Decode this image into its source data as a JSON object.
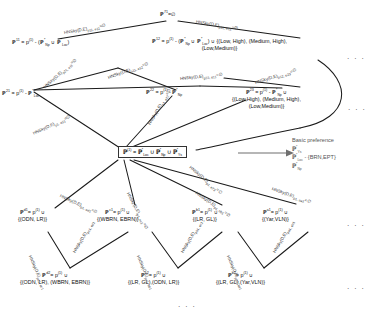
{
  "diagram": {
    "edge_label_base": "HNSky(D,E)",
    "ellipsis": "· · ·",
    "root": {
      "id": "root-box",
      "text": "ℙ⁽¹⁾ = ℙ*Loc ∪ ℙ*Np ∪ ℙ*Ys",
      "html": "<b>ℙ</b><sup>(1)</sup> = <b>ℙ</b><sup>*</sup><sub>Loc</sub> ∪ <b>ℙ</b><sup>*</sup><sub>Np</sub> ∪ <b>ℙ</b><sup>*</sup><sub>Ys</sub>"
    },
    "basic_preference": {
      "heading": "Basic preference",
      "items": [
        "ℙ*Ys",
        "ℙ*Loc - {BRN,EPT}",
        "ℙ*Np"
      ],
      "items_html": [
        "<b>ℙ</b><sup>*</sup><sub>Ys</sub>",
        "<b>ℙ</b><sup>*</sup><sub>Loc</sub> - {BRN,EPT}",
        "<b>ℙ</b><sup>*</sup><sub>Np</sub>"
      ]
    },
    "nodes": [
      {
        "id": "n-p71",
        "label": "ℙ⁷¹ = ∅",
        "html": "<b>ℙ</b><sup>71</sup>=∅",
        "x": 166,
        "y": 13
      },
      {
        "id": "n-p11",
        "label": "ℙ11 = p(1) - (ℙ*Np ∪ ℙ*Loc)",
        "html": "<b>ℙ</b><sup>11</sup> = p<sup>(1)</sup> - (<b>ℙ</b><sup>*</sup><sub>Np</sub> ∪ <b>ℙ</b><sup>*</sup><sub>Loc</sub>)",
        "x": 25,
        "y": 41
      },
      {
        "id": "n-p12",
        "label": "ℙ12 = p(1) - (ℙ*Np ∪ ℙ*Loc) ∪ {(Low, High), (Medium, High), (Low,Medium)}",
        "html": "<b>ℙ</b><sup>12</sup> = p<sup>(1)</sup> - (<b>ℙ</b><sup>*</sup><sub>Np</sub> ∪ <b>ℙ</b><sup>*</sup><sub>Loc</sub>) ∪ {(Low, High), (Medium, High),<br>(Low,Medium)}",
        "x": 157,
        "y": 40
      },
      {
        "id": "n-p21",
        "label": "ℙ21 = p(1) - ℙ*Loc",
        "html": "<b>ℙ</b><sup>21</sup> = p<sup>(1)</sup> - <b>ℙ</b><sup>*</sup><sub>Loc</sub>",
        "x": 8,
        "y": 92
      },
      {
        "id": "n-p22",
        "label": "ℙ22 = p(1) - ℙ*Np",
        "html": "<b>ℙ</b><sup>22</sup> = p<sup>(1)</sup> - <b>ℙ</b><sup>*</sup><sub>Np</sub>",
        "x": 155,
        "y": 91
      },
      {
        "id": "n-p23",
        "label": "ℙ23 = p(1) - ℙ*Np ∪ {(Low,High), (Medium, High), (Low,Medium)}",
        "html": "<b>ℙ</b><sup>23</sup> = p<sup>(1)</sup> - <b>ℙ</b><sup>*</sup><sub>Np</sub> ∪<br>{(Low,High), (Medium, High),<br>(Low,Medium)}",
        "x": 249,
        "y": 91
      },
      {
        "id": "n-pd1",
        "label": "ℙd1 = p(1) ∪ {(ODN, LR)}",
        "html": "<b>ℙ</b><sup>d1</sup>= p<sup>(1)</sup> ∪<br>{(ODN, LR)}",
        "x": 27,
        "y": 211
      },
      {
        "id": "n-pc1",
        "label": "ℙc1 = p(1) ∪ {(WBRN, EBRN)}",
        "html": "<b>ℙ</b><sup>c1</sup>= p<sup>(1)</sup> ∪<br>{(WBRN, EBRN)}",
        "x": 113,
        "y": 211
      },
      {
        "id": "n-pb1",
        "label": "ℙb1 = p(1) ∪ {(LR, GL)}",
        "html": "<b>ℙ</b><sup>b1</sup>= p<sup>(1)</sup> ∪<br>{(LR, GL)}",
        "x": 204,
        "y": 211
      },
      {
        "id": "n-pa1",
        "label": "ℙa1 = p(1) ∪ {(Yar,VLN)}",
        "html": "<b>ℙ</b><sup>a1</sup>= p<sup>(1)</sup> ∪<br>{(Yar,VLN)}",
        "x": 275,
        "y": 211
      },
      {
        "id": "n-pd2",
        "label": "ℙd2 = p(1) ∪ {(ODN, LR), (WBRN, EBRN)}",
        "html": "<b>ℙ</b><sup>d2</sup>= p<sup>(1)</sup> ∪<br>{(ODN, LR), (WBRN, EBRN)}",
        "x": 33,
        "y": 274
      },
      {
        "id": "n-pc2",
        "label": "ℙc2 = p(1) ∪ {(LR, GL),(ODN, LR)}",
        "html": "<b>ℙ</b><sup>c2</sup>= p<sup>(1)</sup> ∪<br>{(LR, GL),(ODN, LR)}",
        "x": 141,
        "y": 274
      },
      {
        "id": "n-pb2",
        "label": "ℙb2 = p(1) ∪ {(LR, GL),(Yar,VLN)}",
        "html": "<b>ℙ</b><sup>b2</sup>= p<sup>(1)</sup> ∪<br>{(LR, GL),(Yar,VLN)}",
        "x": 232,
        "y": 274
      }
    ],
    "edge_labels": [
      {
        "id": "el-1",
        "html": "HNSky(D,E)<sub>p11, e11</sub>=∅",
        "x": 64,
        "y": 30,
        "rot": -10
      },
      {
        "id": "el-2",
        "html": "HNSky(D,E)<sub>p11, e12</sub>=∅",
        "x": 196,
        "y": 19,
        "rot": 9
      },
      {
        "id": "el-3",
        "html": "HNSky(D,E)<sub>p21, e11</sub>=∅",
        "x": 44,
        "y": 85,
        "rot": -42
      },
      {
        "id": "el-4",
        "html": "HNSky(D,E)<sub>a11, e12</sub>=∅",
        "x": 108,
        "y": 75,
        "rot": -20
      },
      {
        "id": "el-5",
        "html": "HNSky(D,E)<sub>p22, e11</sub>=∅",
        "x": 180,
        "y": 76,
        "rot": -6
      },
      {
        "id": "el-6",
        "html": "HNSky(D,E)<sub>p12, e23</sub>=∅",
        "x": 255,
        "y": 80,
        "rot": -17
      },
      {
        "id": "el-7",
        "html": "HNSky(D,E)<sub>p1, e21</sub>=∅",
        "x": 33,
        "y": 131,
        "rot": -25
      },
      {
        "id": "el-8",
        "html": "HNSky(D,E)<sub>p1, e22</sub>=∅",
        "x": 149,
        "y": 122,
        "rot": -60
      },
      {
        "id": "el-9",
        "html": "HNSky(D,E)<sub>p1, e23</sub>=∅",
        "x": 190,
        "y": 164,
        "rot": 40
      },
      {
        "id": "el-10",
        "html": "HNSky(D,E)<sub>p1, ed1</sub>=∅",
        "x": 60,
        "y": 193,
        "rot": 24
      },
      {
        "id": "el-11",
        "html": "HNSky(D,E)<sub>p1, ec1</sub>=∅",
        "x": 128,
        "y": 190,
        "rot": 62
      },
      {
        "id": "el-12",
        "html": "HNSky(D,E)<sub>p1, eb1</sub>=∅",
        "x": 196,
        "y": 190,
        "rot": 34
      },
      {
        "id": "el-13",
        "html": "HNSky(D,E)<sub>p1, ea1</sub>=∅",
        "x": 272,
        "y": 186,
        "rot": 19
      },
      {
        "id": "el-14",
        "html": "HNSky(D,E)<sub>pd1, ec1</sub>",
        "x": 30,
        "y": 253,
        "rot": 66
      },
      {
        "id": "el-15",
        "html": "HNSky(D,E)<sub>pc1, ed1</sub>",
        "x": 74,
        "y": 250,
        "rot": -60
      },
      {
        "id": "el-16",
        "html": "HNSky(D,E)<sub>pc1, eb1</sub>",
        "x": 138,
        "y": 253,
        "rot": 66
      },
      {
        "id": "el-17",
        "html": "HNSky(D,E)<sub>pb1, ec1</sub>",
        "x": 182,
        "y": 250,
        "rot": -60
      },
      {
        "id": "el-18",
        "html": "HNSky(D,E)<sub>pb1, ea1</sub>",
        "x": 228,
        "y": 253,
        "rot": 66
      },
      {
        "id": "el-19",
        "html": "HNSky(D,E)<sub>pa1, eb1</sub>",
        "x": 274,
        "y": 250,
        "rot": -60
      }
    ],
    "ellipses": [
      {
        "id": "dots-r1",
        "x": 347,
        "y": 55
      },
      {
        "id": "dots-r2",
        "x": 348,
        "y": 106
      },
      {
        "id": "dots-r3",
        "x": 347,
        "y": 222
      },
      {
        "id": "dots-r4",
        "x": 347,
        "y": 285
      },
      {
        "id": "dots-bottom",
        "x": 178,
        "y": 303
      }
    ]
  }
}
